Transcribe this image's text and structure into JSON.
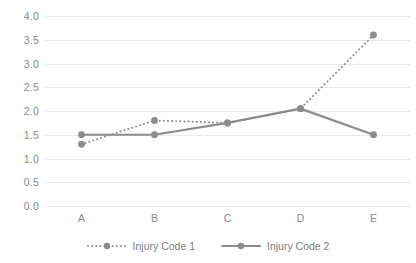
{
  "chart_data": {
    "type": "line",
    "title": "",
    "xlabel": "",
    "ylabel": "",
    "categories": [
      "A",
      "B",
      "C",
      "D",
      "E"
    ],
    "ylim": [
      0.0,
      4.0
    ],
    "yticks": [
      "0.0",
      "0.5",
      "1.0",
      "1.5",
      "2.0",
      "2.5",
      "3.0",
      "3.5",
      "4.0"
    ],
    "ytick_values": [
      0.0,
      0.5,
      1.0,
      1.5,
      2.0,
      2.5,
      3.0,
      3.5,
      4.0
    ],
    "grid": true,
    "legend_position": "bottom",
    "series": [
      {
        "name": "Injury Code 1",
        "style": "dotted",
        "color": "#8c8c8c",
        "marker": "circle",
        "values": [
          1.3,
          1.8,
          1.75,
          2.05,
          3.6
        ]
      },
      {
        "name": "Injury Code 2",
        "style": "solid",
        "color": "#8c8c8c",
        "marker": "circle",
        "values": [
          1.5,
          1.5,
          1.75,
          2.05,
          1.5
        ]
      }
    ]
  },
  "colors": {
    "series_gray": "#8c8c8c",
    "gridline": "#e9e9e9",
    "tick_text": "#8a8a8a",
    "legend_text": "#7d7d7d",
    "background": "#ffffff"
  }
}
